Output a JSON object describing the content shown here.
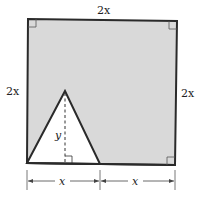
{
  "diagram": {
    "type": "geometry",
    "labels": {
      "top": "2x",
      "left": "2x",
      "right": "2x",
      "height": "y",
      "base_left": "x",
      "base_right": "x"
    },
    "colors": {
      "shade": "#d9d9d9",
      "stroke": "#2a2a2a",
      "triangle_fill": "#ffffff"
    }
  }
}
